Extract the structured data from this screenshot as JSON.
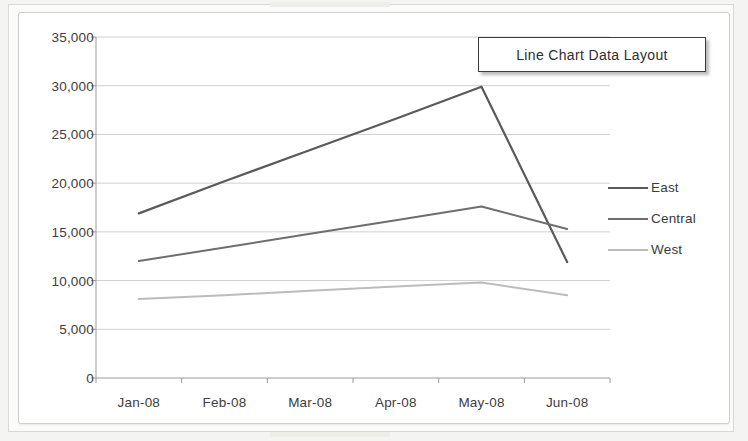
{
  "document": {
    "kind": "scanned-figure-page"
  },
  "callout": {
    "title": "Line Chart Data Layout"
  },
  "chart_data": {
    "type": "line",
    "title": "Line Chart Data Layout",
    "xlabel": "",
    "ylabel": "",
    "grid": true,
    "legend_position": "right",
    "categories": [
      "Jan-08",
      "Feb-08",
      "Mar-08",
      "Apr-08",
      "May-08",
      "Jun-08"
    ],
    "ylim": [
      0,
      35000
    ],
    "yticks": [
      0,
      5000,
      10000,
      15000,
      20000,
      25000,
      30000,
      35000
    ],
    "ytick_labels": [
      "0",
      "5,000",
      "10,000",
      "15,000",
      "20,000",
      "25,000",
      "30,000",
      "35,000"
    ],
    "series": [
      {
        "name": "East",
        "color": "#5a5a5a",
        "width": 2.2,
        "values": [
          16900,
          20200,
          23400,
          26600,
          29900,
          11900
        ]
      },
      {
        "name": "Central",
        "color": "#6e6e6e",
        "width": 2.0,
        "values": [
          12000,
          13400,
          14800,
          16200,
          17600,
          15300
        ]
      },
      {
        "name": "West",
        "color": "#bcbcbc",
        "width": 2.0,
        "values": [
          8100,
          8500,
          8950,
          9400,
          9800,
          8500
        ]
      }
    ]
  },
  "axis_style": {
    "gridline_color": "#d0d0d0",
    "axis_color": "#9a9a9a",
    "text_color": "#3d3d3d"
  },
  "geometry": {
    "plot_left": 96,
    "plot_right": 610,
    "plot_top": 37,
    "plot_bottom": 378
  }
}
